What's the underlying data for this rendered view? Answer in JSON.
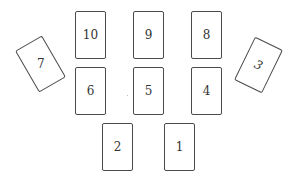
{
  "diagram": {
    "type": "card-spread-layout",
    "cards": [
      {
        "position": "1",
        "label": "1"
      },
      {
        "position": "2",
        "label": "2"
      },
      {
        "position": "3",
        "label": "3"
      },
      {
        "position": "4",
        "label": "4"
      },
      {
        "position": "5",
        "label": "5"
      },
      {
        "position": "6",
        "label": "6"
      },
      {
        "position": "7",
        "label": "7"
      },
      {
        "position": "8",
        "label": "8"
      },
      {
        "position": "9",
        "label": "9"
      },
      {
        "position": "10",
        "label": "10"
      }
    ],
    "colors": {
      "card_border": "#4a4a4a",
      "card_fill": "#ffffff",
      "text": "#333333",
      "background": "#ffffff"
    }
  }
}
